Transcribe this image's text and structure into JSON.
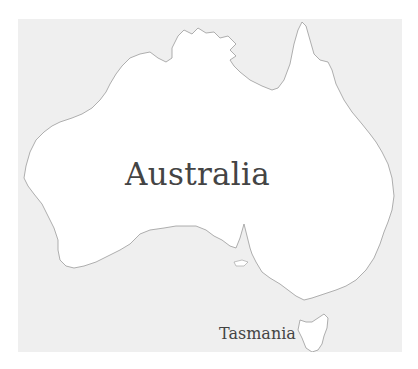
{
  "map": {
    "title": "Australia",
    "colors": {
      "sea": "#efefef",
      "land": "#ffffff",
      "coastline": "#9a9a9a",
      "label": "#444444"
    },
    "labels": [
      {
        "id": "australia",
        "text": "Australia"
      },
      {
        "id": "tasmania",
        "text": "Tasmania"
      }
    ],
    "features": [
      {
        "name": "mainland",
        "type": "landmass"
      },
      {
        "name": "tasmania",
        "type": "island"
      }
    ]
  }
}
